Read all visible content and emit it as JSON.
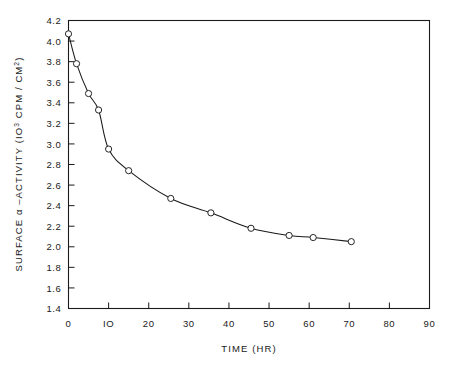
{
  "chart_data": {
    "type": "scatter",
    "title": "",
    "xlabel": "TIME (HR)",
    "ylabel_parts": {
      "pre": "SURFACE α –ACTIVITY  (IO",
      "sup": "3",
      "mid": " CPM / CM",
      "sup2": "2",
      "post": ")"
    },
    "ylabel": "SURFACE α-ACTIVITY (10³ CPM/CM²)",
    "xlim": [
      0,
      90
    ],
    "ylim": [
      1.4,
      4.2
    ],
    "xticks": [
      0,
      10,
      20,
      30,
      40,
      50,
      60,
      70,
      80,
      90
    ],
    "xtick_labels": [
      "0",
      "IO",
      "20",
      "30",
      "40",
      "50",
      "60",
      "70",
      "80",
      "90"
    ],
    "yticks": [
      1.4,
      1.6,
      1.8,
      2.0,
      2.2,
      2.4,
      2.6,
      2.8,
      3.0,
      3.2,
      3.4,
      3.6,
      3.8,
      4.0,
      4.2
    ],
    "ytick_labels": [
      "1.4",
      "1.6",
      "1.8",
      "2.0",
      "2.2",
      "2.4",
      "2.6",
      "2.8",
      "3.0",
      "3.2",
      "3.4",
      "3.6",
      "3.8",
      "4.0",
      "4.2"
    ],
    "grid": false,
    "legend": null,
    "marker_style": "open-circle",
    "line_style": "solid",
    "x": [
      0,
      2,
      5,
      7.5,
      10,
      15,
      25.5,
      35.5,
      45.5,
      55,
      61,
      70.5
    ],
    "y": [
      4.07,
      3.78,
      3.49,
      3.33,
      2.95,
      2.74,
      2.47,
      2.33,
      2.18,
      2.11,
      2.09,
      2.05
    ],
    "points": [
      {
        "x": 0,
        "y": 4.07
      },
      {
        "x": 2,
        "y": 3.78
      },
      {
        "x": 5,
        "y": 3.49
      },
      {
        "x": 7.5,
        "y": 3.33
      },
      {
        "x": 10,
        "y": 2.95
      },
      {
        "x": 15,
        "y": 2.74
      },
      {
        "x": 25.5,
        "y": 2.47
      },
      {
        "x": 35.5,
        "y": 2.33
      },
      {
        "x": 45.5,
        "y": 2.18
      },
      {
        "x": 55,
        "y": 2.11
      },
      {
        "x": 61,
        "y": 2.09
      },
      {
        "x": 70.5,
        "y": 2.05
      }
    ],
    "colors": {
      "axis": "#1a1a1a",
      "curve": "#1a1a1a",
      "marker_fill": "#ffffff",
      "background": "#ffffff"
    }
  }
}
